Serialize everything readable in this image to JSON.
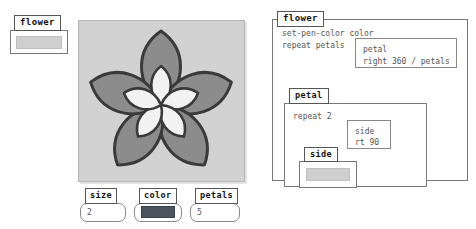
{
  "flower_stub": {
    "tab_label": "flower",
    "placeholder_name": "collapsed-body-placeholder"
  },
  "stage": {
    "name": "drawing-canvas",
    "background_color": "#d2d2d2",
    "petal_outer_fill": "#8c8c8c",
    "petal_inner_fill": "#f2f2f2",
    "outline_color": "#3a3a3a",
    "petal_count": 5
  },
  "widgets": [
    {
      "id": "size",
      "tab_label": "size",
      "value": "2",
      "kind": "number"
    },
    {
      "id": "color",
      "tab_label": "color",
      "value": "",
      "kind": "color",
      "swatch_color": "#4a5560"
    },
    {
      "id": "petals",
      "tab_label": "petals",
      "value": "5",
      "kind": "number"
    }
  ],
  "panel": {
    "tab_label": "flower",
    "code_lines": "set-pen-color color\nrepeat petals",
    "petal_call": {
      "line_1": "petal",
      "line_2": "right 360 / petals"
    },
    "petal_block": {
      "tab_label": "petal",
      "code_lines": "repeat 2",
      "side_call": {
        "line_1": "side",
        "line_2": "rt 90"
      },
      "side_block": {
        "tab_label": "side",
        "placeholder_name": "collapsed-body-placeholder"
      }
    }
  }
}
